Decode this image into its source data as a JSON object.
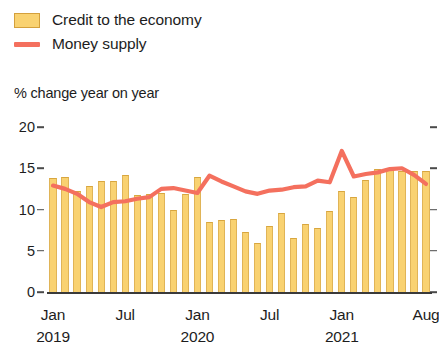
{
  "legend": {
    "items": [
      {
        "label": "Credit to the economy",
        "type": "bar-swatch",
        "color": "#F9D271"
      },
      {
        "label": "Money supply",
        "type": "line-swatch",
        "color": "#F4705E"
      }
    ]
  },
  "subtitle": "% change year on year",
  "axis": {
    "y_ticks": [
      "20",
      "15",
      "10",
      "5",
      "0"
    ],
    "x_ticks": [
      {
        "label": "Jan",
        "year": "2019"
      },
      {
        "label": "Jul",
        "year": ""
      },
      {
        "label": "Jan",
        "year": "2020"
      },
      {
        "label": "Jul",
        "year": ""
      },
      {
        "label": "Jan",
        "year": "2021"
      },
      {
        "label": "Aug",
        "year": ""
      }
    ]
  },
  "chart_data": {
    "type": "bar",
    "title": "",
    "subtitle": "% change year on year",
    "xlabel": "",
    "ylabel": "% change year on year",
    "ylim": [
      0,
      20
    ],
    "yticks": [
      0,
      5,
      10,
      15,
      20
    ],
    "grid": false,
    "legend_position": "top-left",
    "x": [
      "Jan 2019",
      "Feb 2019",
      "Mar 2019",
      "Apr 2019",
      "May 2019",
      "Jun 2019",
      "Jul 2019",
      "Aug 2019",
      "Sep 2019",
      "Oct 2019",
      "Nov 2019",
      "Dec 2019",
      "Jan 2020",
      "Feb 2020",
      "Mar 2020",
      "Apr 2020",
      "May 2020",
      "Jun 2020",
      "Jul 2020",
      "Aug 2020",
      "Sep 2020",
      "Oct 2020",
      "Nov 2020",
      "Dec 2020",
      "Jan 2021",
      "Feb 2021",
      "Mar 2021",
      "Apr 2021",
      "May 2021",
      "Jun 2021",
      "Jul 2021",
      "Aug 2021"
    ],
    "series": [
      {
        "name": "Credit to the economy",
        "type": "bar",
        "color": "#F9D271",
        "values": [
          13.8,
          14.0,
          12.3,
          12.9,
          13.5,
          13.5,
          14.2,
          11.8,
          11.9,
          12.0,
          10.0,
          11.9,
          13.9,
          8.5,
          8.7,
          8.9,
          7.3,
          6.0,
          8.0,
          9.6,
          6.5,
          8.3,
          7.7,
          9.8,
          12.3,
          11.5,
          13.6,
          14.9,
          14.8,
          14.7,
          14.7,
          14.7
        ]
      },
      {
        "name": "Money supply",
        "type": "line",
        "color": "#F4705E",
        "values": [
          12.9,
          12.5,
          11.9,
          10.9,
          10.3,
          10.9,
          11.0,
          11.3,
          11.5,
          12.5,
          12.6,
          12.3,
          12.0,
          14.1,
          13.4,
          12.8,
          12.2,
          11.9,
          12.3,
          12.4,
          12.7,
          12.8,
          13.5,
          13.3,
          17.1,
          14.0,
          14.3,
          14.5,
          14.9,
          15.0,
          14.2,
          13.1
        ]
      }
    ]
  }
}
